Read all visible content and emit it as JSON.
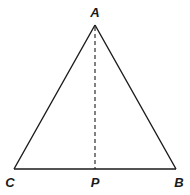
{
  "diagram": {
    "type": "geometry",
    "shape": "triangle",
    "colors": {
      "stroke": "#1a1a1a",
      "background": "#ffffff"
    },
    "vertices": [
      {
        "name": "A",
        "label": "A",
        "x": 95,
        "y": 25
      },
      {
        "name": "B",
        "label": "B",
        "x": 176,
        "y": 169
      },
      {
        "name": "C",
        "label": "C",
        "x": 14,
        "y": 169
      }
    ],
    "points": [
      {
        "name": "P",
        "label": "P",
        "x": 95,
        "y": 169
      }
    ],
    "segments": [
      {
        "from": "A",
        "to": "B",
        "style": "solid"
      },
      {
        "from": "A",
        "to": "C",
        "style": "solid"
      },
      {
        "from": "C",
        "to": "B",
        "style": "solid"
      },
      {
        "from": "A",
        "to": "P",
        "style": "dashed"
      }
    ],
    "labels": {
      "a": "A",
      "b": "B",
      "c": "C",
      "p": "P"
    }
  }
}
